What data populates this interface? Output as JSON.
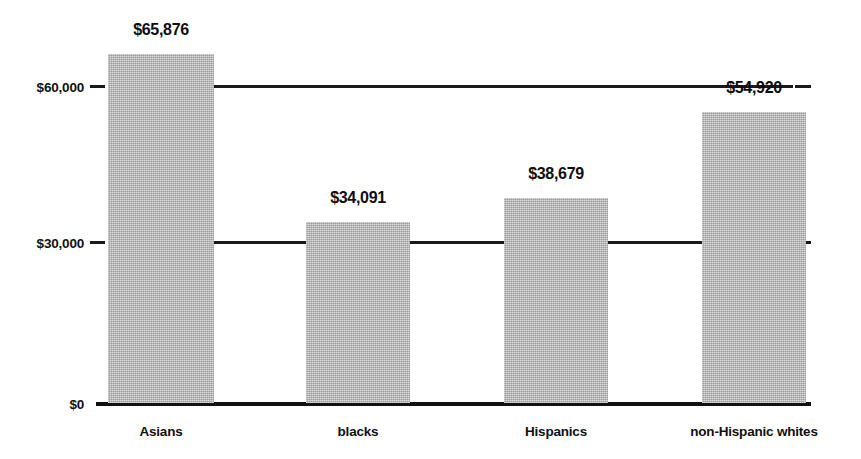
{
  "chart_data": {
    "type": "bar",
    "title": "",
    "subtitle": "",
    "xlabel": "",
    "ylabel": "",
    "categories": [
      "Asians",
      "blacks",
      "Hispanics",
      "non-Hispanic whites"
    ],
    "values": [
      65876,
      34091,
      38679,
      54920
    ],
    "value_labels": [
      "$65,876",
      "$34,091",
      "$38,679",
      "$54,920"
    ],
    "ylim": [
      0,
      69000
    ],
    "yticks": [
      0,
      30000,
      60000
    ],
    "ytick_labels": [
      "$0",
      "$30,000",
      "$60,000"
    ],
    "grid": true,
    "grid_axis": "y",
    "legend": false,
    "legend_position": "none",
    "bar_color": "#b4b4b4",
    "text_color": "#111111",
    "axis_color": "#1a1a1a",
    "background_color": "#ffffff",
    "series": [
      {
        "name": "Median household income",
        "values": [
          65876,
          34091,
          38679,
          54920
        ]
      }
    ],
    "annotations": []
  },
  "axis": {
    "ticks": [
      {
        "label": "$60,000",
        "value": 60000
      },
      {
        "label": "$30,000",
        "value": 30000
      },
      {
        "label": "$0",
        "value": 0
      }
    ]
  },
  "bars": [
    {
      "category": "Asians",
      "value": 65876,
      "label": "$65,876"
    },
    {
      "category": "blacks",
      "value": 34091,
      "label": "$34,091"
    },
    {
      "category": "Hispanics",
      "value": 38679,
      "label": "$38,679"
    },
    {
      "category": "non-Hispanic whites",
      "value": 54920,
      "label": "$54,920"
    }
  ]
}
